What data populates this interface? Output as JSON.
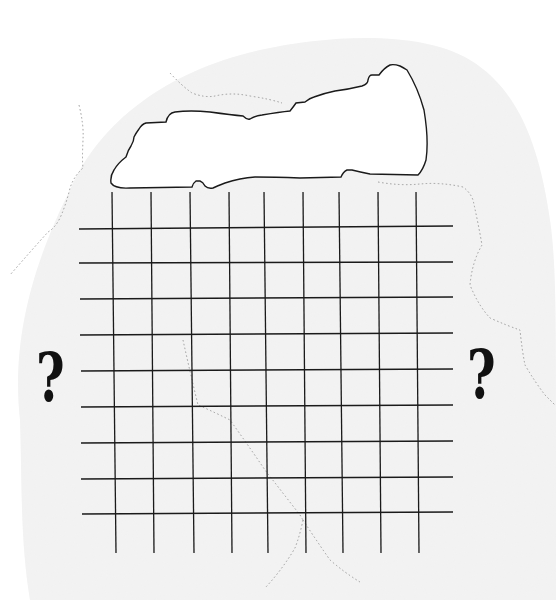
{
  "diagram": {
    "labels": {
      "left_mark": "?",
      "right_mark": "?"
    },
    "grid": {
      "vertical_line_count": 9,
      "horizontal_line_count": 9,
      "vertical_x_top": [
        112,
        151,
        190,
        229,
        264,
        303,
        339,
        378,
        416
      ],
      "vertical_x_bottom": [
        116,
        154,
        194,
        232,
        268,
        306,
        343,
        381,
        419
      ],
      "vertical_y_range": [
        192,
        553
      ],
      "horizontal_y_left": [
        229,
        263,
        299,
        335,
        371,
        407,
        443,
        479,
        514
      ],
      "horizontal_y_right": [
        226,
        262,
        297,
        333,
        369,
        405,
        441,
        477,
        512
      ],
      "horizontal_x_range": [
        79,
        453
      ]
    },
    "colors": {
      "background": "#ffffff",
      "texture": "#f1f1f1",
      "line": "#1a1a1a",
      "dotted": "#9a9a9a"
    }
  }
}
